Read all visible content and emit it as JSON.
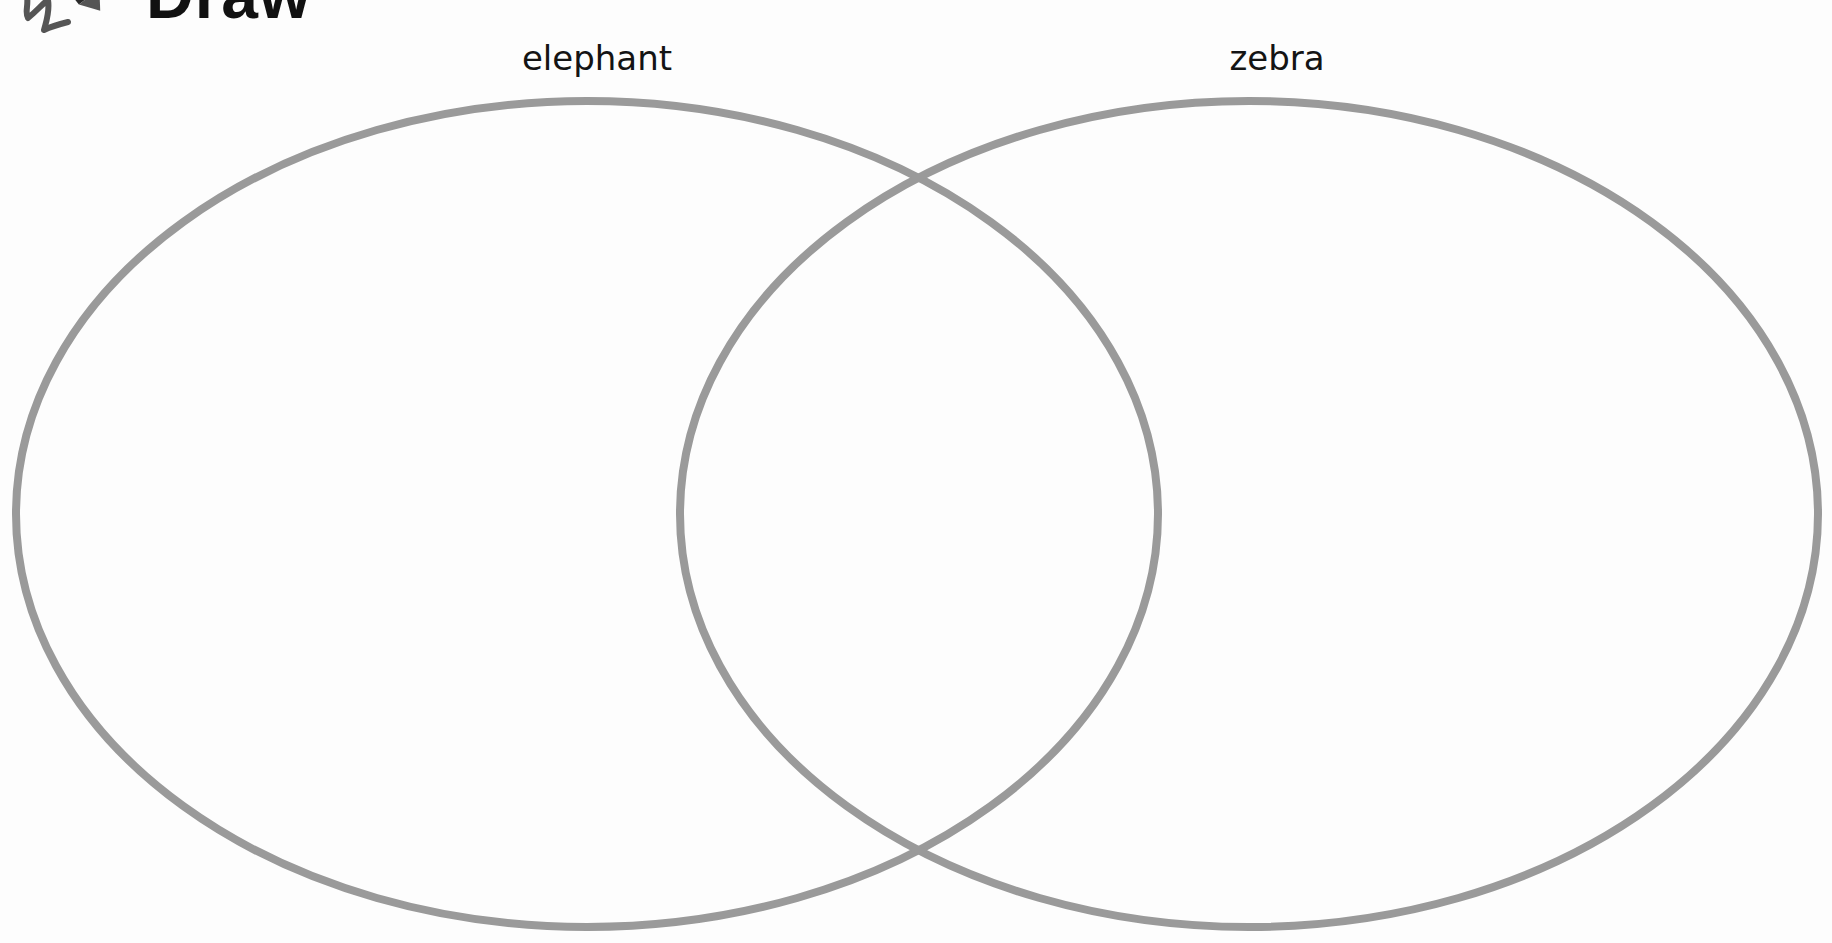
{
  "header": {
    "title": "Draw",
    "icon": "crayon-icon"
  },
  "venn": {
    "type": "venn-diagram",
    "circle_count": 2,
    "stroke_color": "#9a9a9a",
    "sets": [
      {
        "label": "elephant",
        "position": "left"
      },
      {
        "label": "zebra",
        "position": "right"
      }
    ],
    "regions": {
      "left_only": "",
      "overlap": "",
      "right_only": ""
    }
  }
}
